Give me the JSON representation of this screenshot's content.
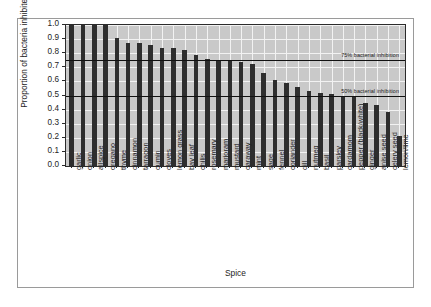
{
  "chart_data": {
    "type": "bar",
    "title": "",
    "xlabel": "Spice",
    "ylabel": "Proportion of bacteria inhibited",
    "ylim": [
      0.0,
      1.0
    ],
    "yticks": [
      "0.0",
      "0.1",
      "0.2",
      "0.3",
      "0.4",
      "0.5",
      "0.6",
      "0.7",
      "0.8",
      "0.9",
      "1.0"
    ],
    "grid": true,
    "legend": "none",
    "categories": [
      "garlic",
      "onion",
      "allspice",
      "oregano",
      "thyme",
      "cinnamon",
      "tarragon",
      "cumin",
      "cloves",
      "lemon grass",
      "bay leaf",
      "chilis",
      "rosemary",
      "marjoram",
      "mustard",
      "caraway",
      "mint",
      "sage",
      "fennel",
      "coriander",
      "dill",
      "nutmeg",
      "basil",
      "parsley",
      "cardamom",
      "pepper (black/white)",
      "ginger",
      "anise seed",
      "celery seed",
      "lemon/lime"
    ],
    "values": [
      1.0,
      1.0,
      1.0,
      1.0,
      0.91,
      0.87,
      0.87,
      0.86,
      0.84,
      0.84,
      0.82,
      0.79,
      0.76,
      0.75,
      0.75,
      0.74,
      0.72,
      0.66,
      0.61,
      0.59,
      0.56,
      0.53,
      0.52,
      0.51,
      0.5,
      0.49,
      0.45,
      0.43,
      0.38,
      0.21
    ],
    "annotations": [
      {
        "name": "75% bacterial inhibition",
        "value": 0.75,
        "label": "75% bacterial inhibition"
      },
      {
        "name": "50% bacterial inhibition",
        "value": 0.5,
        "label": "50% bacterial inhibition"
      }
    ]
  }
}
